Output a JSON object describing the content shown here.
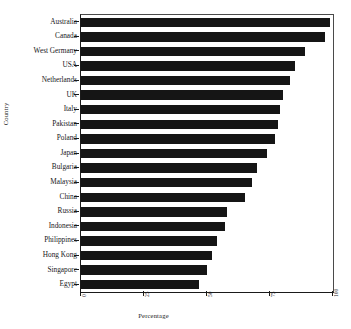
{
  "chart_data": {
    "type": "bar",
    "orientation": "horizontal",
    "title": "",
    "xlabel": "Percentage",
    "ylabel": "Country",
    "xlim": [
      0,
      100
    ],
    "xticks": [
      0,
      25,
      50,
      75,
      100
    ],
    "xtick_labels": [
      "0",
      "25",
      "50",
      "75",
      "100"
    ],
    "grid": false,
    "legend": false,
    "bar_color": "#151515",
    "categories": [
      "Australia",
      "Canada",
      "West Germany",
      "USA",
      "Netherlands",
      "UK",
      "Italy",
      "Pakistan",
      "Poland",
      "Japan",
      "Bulgaria",
      "Malaysia",
      "China",
      "Russia",
      "Indonesia",
      "Philippines",
      "Hong Kong",
      "Singapore",
      "Egypt"
    ],
    "values": [
      99,
      97,
      89,
      85,
      83,
      80,
      79,
      78,
      77,
      74,
      70,
      68,
      65,
      58,
      57,
      54,
      52,
      50,
      47
    ]
  }
}
